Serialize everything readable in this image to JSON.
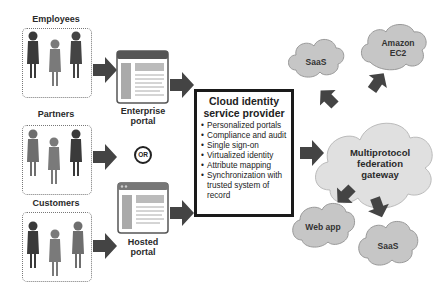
{
  "groups": [
    {
      "id": "employees",
      "label": "Employees"
    },
    {
      "id": "partners",
      "label": "Partners"
    },
    {
      "id": "customers",
      "label": "Customers"
    }
  ],
  "portals": {
    "enterprise": "Enterprise portal",
    "enterprise_l1": "Enterprise",
    "enterprise_l2": "portal",
    "or": "OR",
    "hosted_l1": "Hosted",
    "hosted_l2": "portal"
  },
  "provider": {
    "title_l1": "Cloud identity",
    "title_l2": "service provider",
    "items": [
      "Personalized portals",
      "Compliance and audit",
      "Single sign-on",
      "Virtualized identity",
      "Attribute mapping",
      "Synchronization with trusted system of record"
    ]
  },
  "gateway": {
    "l1": "Multiprotocol",
    "l2": "federation",
    "l3": "gateway"
  },
  "clouds": {
    "saas_top": "SaaS",
    "amazon_l1": "Amazon",
    "amazon_l2": "EC2",
    "webapp": "Web app",
    "saas_bottom": "SaaS"
  },
  "colors": {
    "arrow": "#444444",
    "person_dark": "#3a3a3a",
    "person_light": "#7a7a7a",
    "cloud_fill": "#c8c8c8",
    "gateway_fill": "#dedede"
  }
}
